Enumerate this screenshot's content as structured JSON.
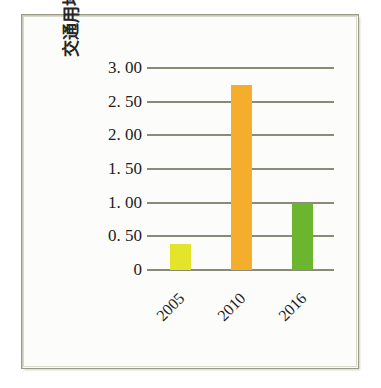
{
  "figure": {
    "background_color": "#fcfcfa",
    "frame_color": "#9a9a86"
  },
  "chart_data": {
    "type": "bar",
    "title": "",
    "xlabel": "",
    "ylabel": "交通用地面积比重/%",
    "categories": [
      "2005",
      "2010",
      "2016"
    ],
    "values": [
      0.39,
      2.75,
      1.0
    ],
    "series": [
      {
        "name": "交通用地面积比重",
        "values": [
          0.39,
          2.75,
          1.0
        ]
      }
    ],
    "bar_colors": [
      "#e4e42b",
      "#f5ae2b",
      "#6cb52e"
    ],
    "ylim": [
      0,
      3.0
    ],
    "ytick_values": [
      3.0,
      2.5,
      2.0,
      1.5,
      1.0,
      0.5,
      0
    ],
    "ytick_labels": [
      "3. 00",
      "2. 50",
      "2. 00",
      "1. 50",
      "1. 00",
      "0. 50",
      "0"
    ],
    "grid": "horizontal",
    "gridline_color": "#8a8a76",
    "legend": "none",
    "xtick_rotation": -45,
    "ylabel_rotation": -90
  },
  "caption": {
    "cropped_text": ""
  }
}
